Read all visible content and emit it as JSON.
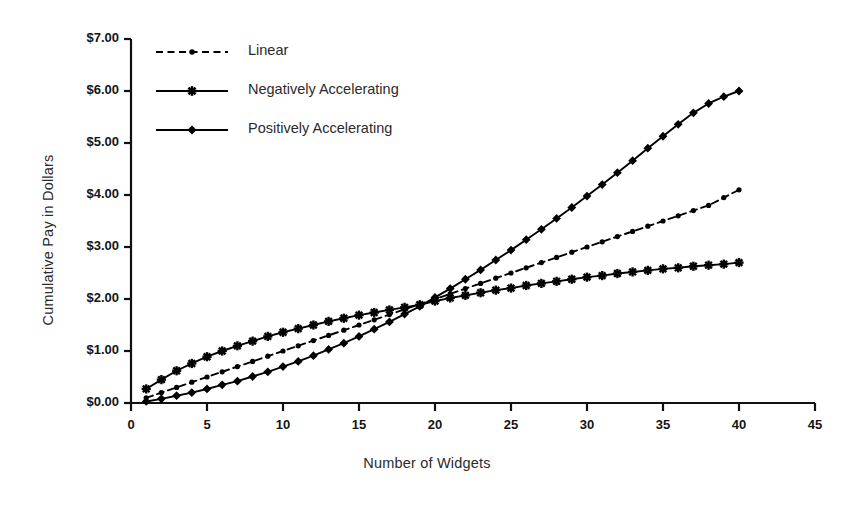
{
  "chart_data": {
    "type": "line",
    "title": "",
    "xlabel": "Number of Widgets",
    "ylabel": "Cumulative Pay in Dollars",
    "xlim": [
      0,
      45
    ],
    "ylim": [
      0,
      7
    ],
    "grid": false,
    "legend_position": "top-left",
    "xticks": [
      "0",
      "5",
      "10",
      "15",
      "20",
      "25",
      "30",
      "35",
      "40",
      "45"
    ],
    "xtick_values": [
      0,
      5,
      10,
      15,
      20,
      25,
      30,
      35,
      40,
      45
    ],
    "yticks": [
      "$0.00",
      "$1.00",
      "$2.00",
      "$3.00",
      "$4.00",
      "$5.00",
      "$6.00",
      "$7.00"
    ],
    "ytick_values": [
      0,
      1,
      2,
      3,
      4,
      5,
      6,
      7
    ],
    "x": [
      1,
      2,
      3,
      4,
      5,
      6,
      7,
      8,
      9,
      10,
      11,
      12,
      13,
      14,
      15,
      16,
      17,
      18,
      19,
      20,
      21,
      22,
      23,
      24,
      25,
      26,
      27,
      28,
      29,
      30,
      31,
      32,
      33,
      34,
      35,
      36,
      37,
      38,
      39,
      40
    ],
    "series": [
      {
        "name": "Linear",
        "marker": "dot",
        "linestyle": "dashed",
        "color": "#000000",
        "values": [
          0.1,
          0.2,
          0.3,
          0.4,
          0.5,
          0.6,
          0.7,
          0.8,
          0.9,
          1.0,
          1.1,
          1.2,
          1.3,
          1.4,
          1.5,
          1.6,
          1.7,
          1.8,
          1.9,
          2.0,
          2.1,
          2.2,
          2.3,
          2.4,
          2.5,
          2.6,
          2.7,
          2.8,
          2.9,
          3.0,
          3.1,
          3.2,
          3.3,
          3.4,
          3.5,
          3.6,
          3.7,
          3.8,
          3.95,
          4.1
        ]
      },
      {
        "name": "Negatively Accelerating",
        "marker": "star",
        "linestyle": "solid",
        "color": "#000000",
        "values": [
          0.27,
          0.45,
          0.62,
          0.76,
          0.89,
          1.0,
          1.1,
          1.19,
          1.28,
          1.36,
          1.43,
          1.5,
          1.57,
          1.63,
          1.69,
          1.74,
          1.79,
          1.84,
          1.89,
          1.96,
          2.02,
          2.07,
          2.12,
          2.17,
          2.21,
          2.26,
          2.3,
          2.34,
          2.38,
          2.42,
          2.45,
          2.49,
          2.52,
          2.55,
          2.58,
          2.6,
          2.63,
          2.65,
          2.67,
          2.7
        ]
      },
      {
        "name": "Positively Accelerating",
        "marker": "diamond",
        "linestyle": "solid",
        "color": "#000000",
        "values": [
          0.03,
          0.08,
          0.14,
          0.2,
          0.27,
          0.35,
          0.42,
          0.51,
          0.6,
          0.7,
          0.8,
          0.91,
          1.03,
          1.15,
          1.28,
          1.42,
          1.56,
          1.71,
          1.86,
          2.03,
          2.2,
          2.38,
          2.56,
          2.75,
          2.94,
          3.14,
          3.34,
          3.55,
          3.76,
          3.98,
          4.2,
          4.43,
          4.66,
          4.9,
          5.13,
          5.36,
          5.58,
          5.76,
          5.89,
          6.0
        ]
      }
    ]
  },
  "legend": {
    "items": [
      {
        "label": "Linear"
      },
      {
        "label": "Negatively Accelerating"
      },
      {
        "label": "Positively Accelerating"
      }
    ]
  }
}
